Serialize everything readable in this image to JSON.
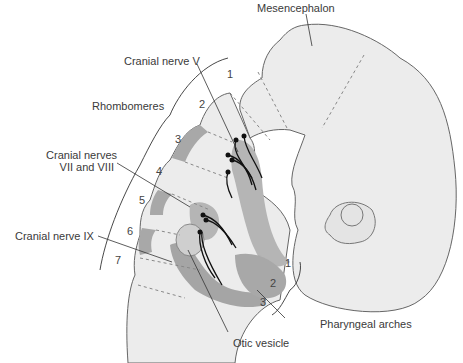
{
  "diagram": {
    "labels": {
      "mesencephalon": "Mesencephalon",
      "cranial_nerve_v": "Cranial nerve V",
      "rhombomeres": "Rhombomeres",
      "cranial_nerves_vii_viii_line1": "Cranial nerves",
      "cranial_nerves_vii_viii_line2": "VII and VIII",
      "cranial_nerve_ix": "Cranial nerve IX",
      "otic_vesicle": "Otic vesicle",
      "pharyngeal_arches": "Pharyngeal arches"
    },
    "rhombomere_numbers": [
      "1",
      "2",
      "3",
      "4",
      "5",
      "6",
      "7"
    ],
    "pharyngeal_arch_numbers": [
      "1",
      "2",
      "3"
    ],
    "colors": {
      "tissue_light": "#ececec",
      "tissue_mid": "#d6d6d6",
      "tissue_dark": "#a8a8a8",
      "outline": "#555555",
      "text": "#3a3a3a"
    }
  }
}
